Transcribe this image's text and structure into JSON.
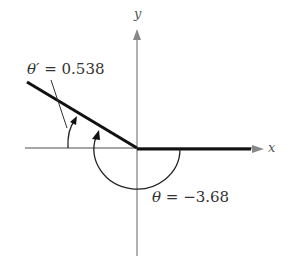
{
  "figure": {
    "x_axis_label": "x",
    "y_axis_label": "y",
    "reference_angle": {
      "symbol": "θ′",
      "equals": " = ",
      "value": "0.538",
      "full_label": "θ′ = 0.538"
    },
    "angle": {
      "symbol": "θ",
      "equals": " = ",
      "value": "−3.68",
      "full_label": "θ = −3.68"
    },
    "colors": {
      "axis": "#777777",
      "terminal_side": "#111111",
      "arc": "#222222",
      "text": "#333333"
    }
  }
}
